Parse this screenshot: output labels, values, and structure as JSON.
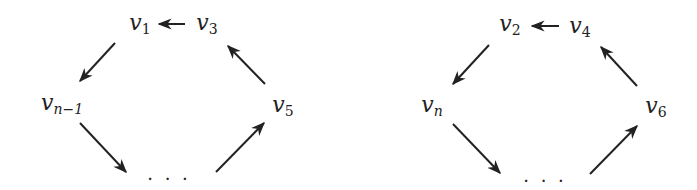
{
  "diagrams": [
    {
      "name": "odd-cycle",
      "nodes": [
        {
          "id": "v1",
          "base": "v",
          "sub": "1",
          "x": 140,
          "y": 24
        },
        {
          "id": "v3",
          "base": "v",
          "sub": "3",
          "x": 207,
          "y": 24
        },
        {
          "id": "vn-1",
          "base": "v",
          "sub": "n−1",
          "x": 60,
          "y": 104
        },
        {
          "id": "v5",
          "base": "v",
          "sub": "5",
          "x": 283,
          "y": 106
        },
        {
          "id": "dots",
          "label": "· · ·",
          "x": 169,
          "y": 180
        }
      ],
      "edges": [
        {
          "from": "v3",
          "to": "v1"
        },
        {
          "from": "v1",
          "to": "vn-1"
        },
        {
          "from": "vn-1",
          "to": "dots"
        },
        {
          "from": "dots",
          "to": "v5"
        },
        {
          "from": "v5",
          "to": "v3"
        }
      ]
    },
    {
      "name": "even-cycle",
      "nodes": [
        {
          "id": "v2",
          "base": "v",
          "sub": "2",
          "x": 510,
          "y": 25
        },
        {
          "id": "v4",
          "base": "v",
          "sub": "4",
          "x": 580,
          "y": 27
        },
        {
          "id": "vn",
          "base": "v",
          "sub": "n",
          "x": 432,
          "y": 106
        },
        {
          "id": "v6",
          "base": "v",
          "sub": "6",
          "x": 655,
          "y": 107
        },
        {
          "id": "dots",
          "label": "· · ·",
          "x": 545,
          "y": 182
        }
      ],
      "edges": [
        {
          "from": "v4",
          "to": "v2"
        },
        {
          "from": "v2",
          "to": "vn"
        },
        {
          "from": "vn",
          "to": "dots"
        },
        {
          "from": "dots",
          "to": "v6"
        },
        {
          "from": "v6",
          "to": "v4"
        }
      ]
    }
  ],
  "labels": {
    "v1": "v",
    "v1_sub": "1",
    "v3": "v",
    "v3_sub": "3",
    "vn1": "v",
    "vn1_sub": "n−1",
    "v5": "v",
    "v5_sub": "5",
    "dotsL": "· · ·",
    "v2": "v",
    "v2_sub": "2",
    "v4": "v",
    "v4_sub": "4",
    "vn": "v",
    "vn_sub": "n",
    "v6": "v",
    "v6_sub": "6",
    "dotsR": "· · ·"
  },
  "colors": {
    "stroke": "#222222",
    "text": "#222222",
    "background": "#ffffff"
  }
}
